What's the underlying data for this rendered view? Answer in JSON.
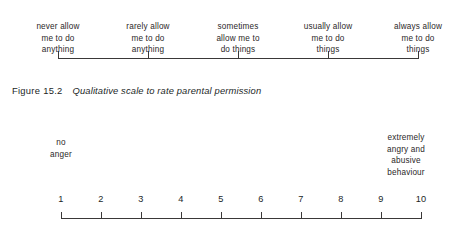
{
  "figure_1": {
    "caption_number": "Figure 15.2",
    "caption_title": "Qualitative scale to rate parental permission",
    "axis": {
      "start_x": 58,
      "end_x": 418,
      "tick_positions": [
        58,
        148,
        238,
        328,
        418
      ],
      "tick_direction": "up"
    },
    "labels": [
      {
        "text": "never allow\nme to do\nanything",
        "tick_x": 58
      },
      {
        "text": "rarely allow\nme to do\nanything",
        "tick_x": 148
      },
      {
        "text": "sometimes\nallow me to\ndo things",
        "tick_x": 238
      },
      {
        "text": "usually allow\nme to do\nthings",
        "tick_x": 328
      },
      {
        "text": "always allow\nme to do\nthings",
        "tick_x": 418
      }
    ]
  },
  "figure_2": {
    "anchor_left": "no\nanger",
    "anchor_right": "extremely\nangry and\nabusive\nbehaviour",
    "axis": {
      "start_x": 61,
      "end_x": 421,
      "tick_direction": "up"
    },
    "numbers": [
      "1",
      "2",
      "3",
      "4",
      "5",
      "6",
      "7",
      "8",
      "9",
      "10"
    ],
    "tick_positions": [
      61,
      101,
      141,
      181,
      221,
      261,
      301,
      341,
      381,
      421
    ]
  },
  "chart_data": {
    "type": "table",
    "title": "Qualitative scale to rate parental permission",
    "charts": [
      {
        "type": "line",
        "name": "Qualitative scale to rate parental permission",
        "orientation": "horizontal",
        "grid": false,
        "legend": "none",
        "categories": [
          "never allow me to do anything",
          "rarely allow me to do anything",
          "sometimes allow me to do things",
          "usually allow me to do things",
          "always allow me to do things"
        ],
        "values": [
          1,
          2,
          3,
          4,
          5
        ],
        "xlabel": "",
        "ylabel": "",
        "tick_labels": [
          "never allow me to do anything",
          "rarely allow me to do anything",
          "sometimes allow me to do things",
          "usually allow me to do things",
          "always allow me to do things"
        ]
      },
      {
        "type": "line",
        "name": "Anger rating scale",
        "orientation": "horizontal",
        "grid": false,
        "legend": "none",
        "categories": [
          "1",
          "2",
          "3",
          "4",
          "5",
          "6",
          "7",
          "8",
          "9",
          "10"
        ],
        "values": [
          1,
          2,
          3,
          4,
          5,
          6,
          7,
          8,
          9,
          10
        ],
        "xlim": [
          1,
          10
        ],
        "xlabel": "",
        "ylabel": "",
        "annotations": [
          {
            "text": "no anger",
            "at": "1"
          },
          {
            "text": "extremely angry and abusive behaviour",
            "at": "10"
          }
        ]
      }
    ]
  },
  "colors": {
    "ink": "#221f1f",
    "rule": "#3a3838",
    "background": "#ffffff"
  }
}
